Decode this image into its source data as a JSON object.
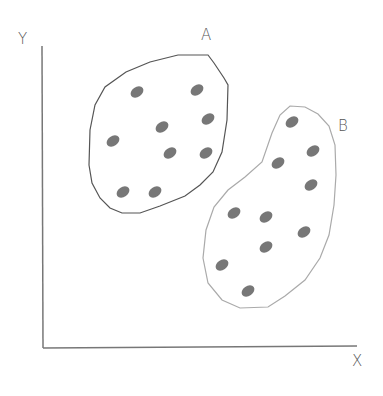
{
  "diagram": {
    "type": "cluster-diagram",
    "axes": {
      "x_label": "X",
      "y_label": "Y"
    },
    "clusters": [
      {
        "label": "A",
        "outline_color": "#555555",
        "point_count": 9,
        "points": [
          [
            137,
            92
          ],
          [
            197,
            90
          ],
          [
            162,
            127
          ],
          [
            208,
            119
          ],
          [
            113,
            141
          ],
          [
            170,
            153
          ],
          [
            206,
            153
          ],
          [
            123,
            192
          ],
          [
            155,
            192
          ]
        ]
      },
      {
        "label": "B",
        "outline_color": "#aaaaaa",
        "point_count": 10,
        "points": [
          [
            292,
            122
          ],
          [
            313,
            151
          ],
          [
            278,
            163
          ],
          [
            311,
            185
          ],
          [
            234,
            213
          ],
          [
            266,
            217
          ],
          [
            304,
            232
          ],
          [
            266,
            247
          ],
          [
            222,
            265
          ],
          [
            248,
            291
          ]
        ]
      }
    ],
    "point_color": "#777777"
  }
}
